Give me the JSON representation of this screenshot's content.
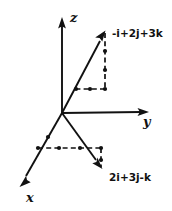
{
  "figure": {
    "background_color": "#ffffff",
    "ink_color": "#111111",
    "width": 172,
    "height": 211
  },
  "axes": [
    {
      "name": "z",
      "label": "z",
      "direction": "up",
      "origin": [
        62,
        113
      ],
      "tip": [
        62,
        18
      ],
      "arrow": true
    },
    {
      "name": "y",
      "label": "y",
      "direction": "right",
      "origin": [
        62,
        113
      ],
      "tip": [
        148,
        112
      ],
      "arrow": true
    },
    {
      "name": "x",
      "label": "x",
      "direction": "down-left",
      "origin": [
        62,
        113
      ],
      "tip": [
        20,
        186
      ],
      "arrow": true
    }
  ],
  "axis_labels": {
    "z": {
      "text": "z",
      "x": 70,
      "y": 22
    },
    "y": {
      "text": "y",
      "x": 143,
      "y": 126
    },
    "x": {
      "text": "x",
      "x": 26,
      "y": 202
    }
  },
  "vectors": [
    {
      "name": "vector-upper",
      "label": "-i+2j+3k",
      "components": {
        "i": -1,
        "j": 2,
        "k": 3
      },
      "start": [
        62,
        113
      ],
      "tip": [
        105,
        32
      ],
      "arrow": true,
      "label_position": [
        113,
        36
      ],
      "projection": {
        "foot_in_plane": [
          105,
          89
        ],
        "path_start": [
          76,
          89
        ],
        "description": "vertical drop from tip to xy-plane, then dashed run to axis"
      }
    },
    {
      "name": "vector-lower",
      "label": "2i+3j-k",
      "components": {
        "i": 2,
        "j": 3,
        "k": -1
      },
      "start": [
        62,
        113
      ],
      "tip": [
        102,
        168
      ],
      "arrow": true,
      "label_position": [
        110,
        180
      ],
      "projection": {
        "foot_in_plane": [
          101,
          148
        ],
        "path_start": [
          38,
          148
        ],
        "description": "dashed run in xy-plane then short dashed drop to tip"
      }
    }
  ],
  "marker_dots": [
    {
      "name": "dot-upper-vertical-1",
      "x": 105,
      "y": 89
    },
    {
      "name": "dot-upper-vertical-2",
      "x": 105,
      "y": 70
    },
    {
      "name": "dot-upper-vertical-3",
      "x": 105,
      "y": 51
    },
    {
      "name": "dot-upper-horizontal-1",
      "x": 90,
      "y": 89
    },
    {
      "name": "dot-upper-horizontal-2",
      "x": 76,
      "y": 89
    },
    {
      "name": "dot-lower-plane-1",
      "x": 38,
      "y": 148
    },
    {
      "name": "dot-lower-plane-2",
      "x": 59,
      "y": 148
    },
    {
      "name": "dot-lower-plane-3",
      "x": 80,
      "y": 148
    },
    {
      "name": "dot-lower-plane-4",
      "x": 101,
      "y": 148
    },
    {
      "name": "dot-lower-drop-1",
      "x": 101,
      "y": 160
    },
    {
      "name": "dot-x-axis-1",
      "x": 48,
      "y": 137
    },
    {
      "name": "dot-x-axis-2",
      "x": 38,
      "y": 148
    }
  ]
}
